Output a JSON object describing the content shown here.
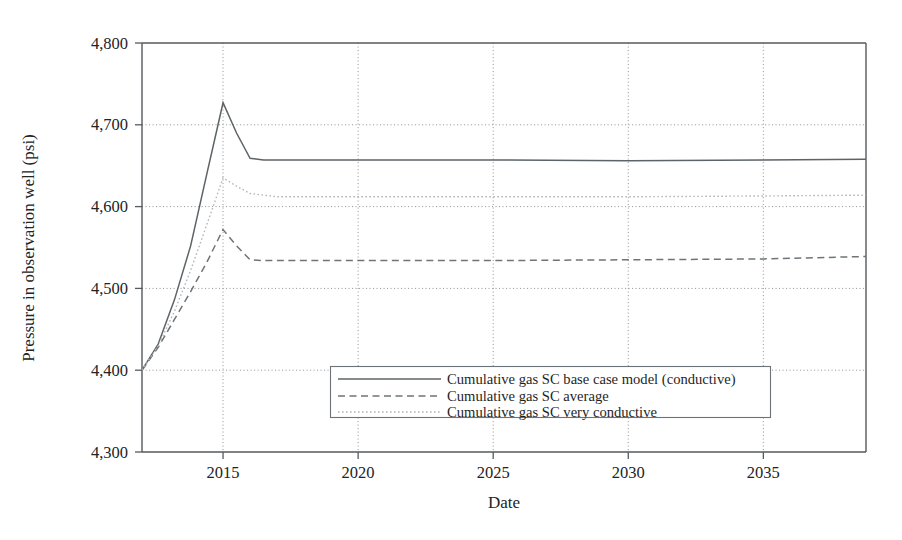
{
  "chart_data": {
    "type": "line",
    "title": "",
    "xlabel": "Date",
    "ylabel": "Pressure in observation well (psi)",
    "xlim": [
      2012.0,
      2038.8
    ],
    "ylim": [
      4300,
      4800
    ],
    "yticks": [
      4300,
      4400,
      4500,
      4600,
      4700,
      4800
    ],
    "ytick_labels": [
      "4,300",
      "4,400",
      "4,500",
      "4,600",
      "4,700",
      "4,800"
    ],
    "xticks": [
      2015,
      2020,
      2025,
      2030,
      2035
    ],
    "xtick_labels": [
      "2015",
      "2020",
      "2025",
      "2030",
      "2035"
    ],
    "grid": true,
    "legend_position": "lower center",
    "series": [
      {
        "name": "Cumulative gas SC base case model (conductive)",
        "style": "solid",
        "color": "#5d6367",
        "x": [
          2012.0,
          2012.6,
          2013.2,
          2013.8,
          2014.4,
          2015.0,
          2015.5,
          2016.0,
          2016.5,
          2020.0,
          2025.0,
          2030.0,
          2035.0,
          2038.8
        ],
        "values": [
          4400,
          4432,
          4486,
          4552,
          4640,
          4727,
          4690,
          4659,
          4657,
          4657,
          4657,
          4656,
          4657,
          4658
        ]
      },
      {
        "name": "Cumulative gas SC average",
        "style": "dashed",
        "color": "#6e7478",
        "x": [
          2012.0,
          2012.6,
          2013.2,
          2013.8,
          2014.4,
          2015.0,
          2015.5,
          2016.0,
          2016.5,
          2020.0,
          2025.0,
          2030.0,
          2035.0,
          2038.8
        ],
        "values": [
          4400,
          4428,
          4462,
          4496,
          4532,
          4572,
          4552,
          4535,
          4534,
          4534,
          4534,
          4535,
          4536,
          4539
        ]
      },
      {
        "name": "Cumulative gas SC very conductive",
        "style": "dotted",
        "color": "#b3b6b8",
        "x": [
          2012.0,
          2012.6,
          2013.2,
          2013.8,
          2014.4,
          2015.0,
          2015.5,
          2016.0,
          2017.0,
          2020.0,
          2025.0,
          2030.0,
          2035.0,
          2038.8
        ],
        "values": [
          4400,
          4430,
          4472,
          4522,
          4578,
          4635,
          4625,
          4616,
          4612,
          4612,
          4612,
          4612,
          4613,
          4614
        ]
      }
    ]
  },
  "legend": {
    "entries": [
      "Cumulative gas SC base case model (conductive)",
      "Cumulative gas SC average",
      "Cumulative gas SC very conductive"
    ]
  }
}
